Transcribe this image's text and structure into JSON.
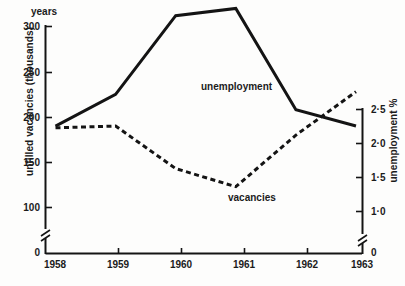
{
  "figure": {
    "corner_label": "years"
  },
  "axes": {
    "left": {
      "title": "unfilled vacancies (thousands)",
      "ticks": [
        "300",
        "250",
        "200",
        "150",
        "100",
        "0"
      ],
      "has_break": true
    },
    "right": {
      "title": "unemployment %",
      "ticks": [
        "2·5",
        "2·0",
        "1·5",
        "1·0",
        "0"
      ],
      "has_break": true
    },
    "bottom": {
      "ticks": [
        "1958",
        "1959",
        "1960",
        "1961",
        "1962",
        "1963"
      ]
    }
  },
  "series_labels": {
    "unemployment": "unemployment",
    "vacancies": "vacancies"
  },
  "chart_data": {
    "type": "line",
    "title": "",
    "subtitle": "",
    "xlabel": "years",
    "ylabel": "unfilled vacancies (thousands)",
    "y2label": "unemployment %",
    "x": [
      "1958",
      "1959",
      "1960",
      "1961",
      "1962",
      "1963"
    ],
    "xlim": [
      "1958",
      "1963"
    ],
    "ylim": [
      100,
      300
    ],
    "y2lim": [
      1.0,
      2.5
    ],
    "grid": false,
    "legend": "inline-annotations",
    "axis_break_left": "between 0 and 100",
    "axis_break_right": "between 0 and 1·0",
    "series": [
      {
        "name": "unemployment",
        "axis": "right",
        "style": "solid",
        "color": "#141414",
        "units": "%",
        "values": [
          2.05,
          2.33,
          3.15,
          3.22,
          2.17,
          2.0
        ],
        "values_left_scale": [
          190,
          225,
          312,
          320,
          208,
          190
        ]
      },
      {
        "name": "vacancies",
        "axis": "left",
        "style": "dashed",
        "color": "#141414",
        "units": "thousands",
        "values": [
          188,
          190,
          143,
          123,
          180,
          228
        ]
      }
    ]
  }
}
